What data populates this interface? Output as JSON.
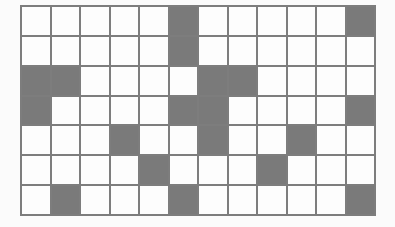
{
  "grid": {
    "rows": 7,
    "cols": 12,
    "colors": {
      "filled": "#7a7a7a",
      "empty": "#fdfdfd",
      "line": "#7d7d7d"
    },
    "filled_cells": [
      [
        0,
        5
      ],
      [
        0,
        11
      ],
      [
        1,
        5
      ],
      [
        2,
        0
      ],
      [
        2,
        1
      ],
      [
        2,
        6
      ],
      [
        2,
        7
      ],
      [
        3,
        0
      ],
      [
        3,
        5
      ],
      [
        3,
        6
      ],
      [
        3,
        11
      ],
      [
        4,
        3
      ],
      [
        4,
        6
      ],
      [
        4,
        9
      ],
      [
        5,
        4
      ],
      [
        5,
        8
      ],
      [
        6,
        1
      ],
      [
        6,
        5
      ],
      [
        6,
        11
      ]
    ],
    "pattern": [
      "000001000001",
      "000001000000",
      "110000110000",
      "100001100001",
      "000100100100",
      "000010001000",
      "010001000001"
    ]
  }
}
